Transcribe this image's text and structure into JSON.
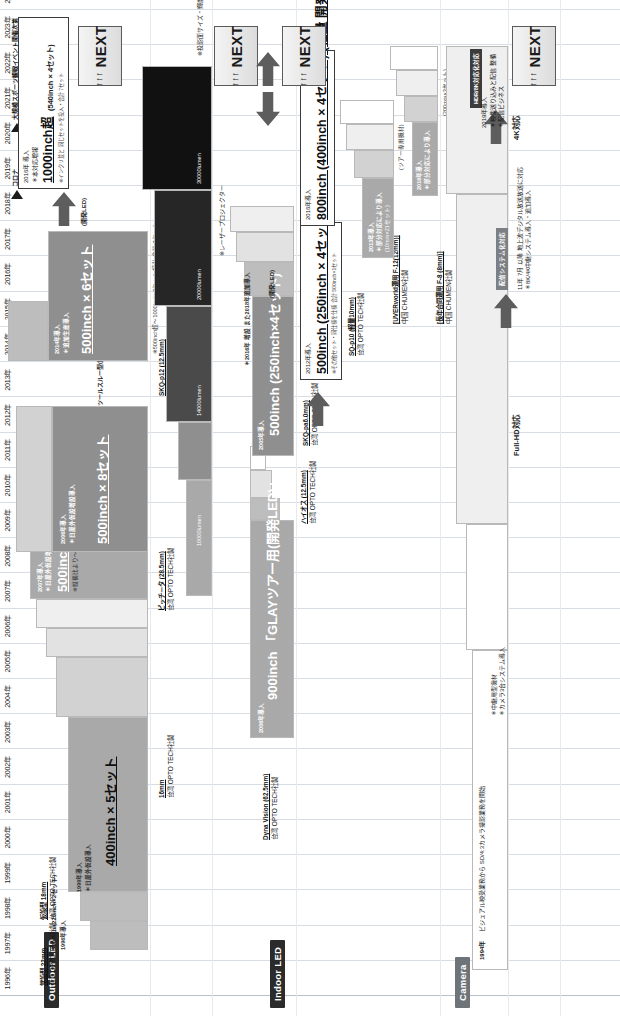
{
  "chart_data": {
    "type": "bar",
    "xlabel": "年",
    "ylabel": "",
    "grid": true,
    "legend": "none",
    "x": [
      "1996年",
      "1997年",
      "1998年",
      "1999年",
      "2000年",
      "2001年",
      "2002年",
      "2003年",
      "2004年",
      "2005年",
      "2006年",
      "2007年",
      "2008年",
      "2009年",
      "2010年",
      "2011年",
      "2012年",
      "2013年",
      "2014年",
      "2015年",
      "2016年",
      "2017年",
      "2018年",
      "2019年",
      "2020年",
      "2021年",
      "2022年",
      "2023年",
      "2024年"
    ],
    "series": [
      {
        "name": "Projector 明るさ (lumen)",
        "unit": "lumen",
        "values": [
          null,
          null,
          null,
          null,
          null,
          null,
          null,
          null,
          null,
          null,
          null,
          null,
          null,
          null,
          5000,
          10000,
          14000,
          14000,
          20000,
          20000,
          30000,
          30000,
          30000,
          30000,
          30000,
          30000,
          30000,
          30000,
          30000
        ]
      },
      {
        "name": "Outdoor LED 画面サイズ (inch)",
        "unit": "inch",
        "values": [
          null,
          200,
          200,
          400,
          400,
          400,
          400,
          400,
          400,
          500,
          500,
          500,
          500,
          500,
          500,
          500,
          500,
          500,
          500,
          500,
          500,
          500,
          500,
          500,
          500,
          500,
          500,
          500,
          500
        ]
      },
      {
        "name": "Indoor LED 画面サイズ (inch)",
        "unit": "inch",
        "values": [
          null,
          null,
          null,
          null,
          null,
          null,
          null,
          null,
          null,
          900,
          900,
          900,
          900,
          900,
          900,
          900,
          500,
          500,
          500,
          500,
          800,
          800,
          800,
          800,
          800,
          800,
          800,
          800,
          1000
        ]
      }
    ]
  },
  "axis": {
    "years": [
      "1996年",
      "1997年",
      "1998年",
      "1999年",
      "2000年",
      "2001年",
      "2002年",
      "2003年",
      "2004年",
      "2005年",
      "2006年",
      "2007年",
      "2008年",
      "2009年",
      "2010年",
      "2011年",
      "2012年",
      "2013年",
      "2014年",
      "2015年",
      "2016年",
      "2017年",
      "2018年",
      "2019年",
      "2020年",
      "2021年",
      "2022年",
      "2023年",
      "2024年"
    ],
    "markers": [
      {
        "label": "コロナ",
        "year": "2020年"
      },
      {
        "label": "大規模スポーツ観戦イベント開催次第",
        "year": "2022年"
      }
    ]
  },
  "categories": {
    "projector": "Projector",
    "outdoor_led": "Outdoor LED",
    "indoor_led": "Indoor LED",
    "camera": "Camera"
  },
  "projector": {
    "lumens": [
      "10000lumen",
      "14000lumen",
      "20000lumen",
      "30000lumen"
    ],
    "laser_note": "※レーザープロジェクター",
    "next_note": "※投影面サイズ・輝度・パワーを更に大きく＝60000lm",
    "next": {
      "label": "NEXT",
      "arrows": "↑↑↑"
    }
  },
  "outdoor_led": {
    "head_1": {
      "title": "常設型 22mm",
      "vendor": "台湾 OPTO TECH社製"
    },
    "head_2": {
      "title": "仮設型 18mm",
      "vendor": "台湾 OPTO TECH社製"
    },
    "bar_1994": {
      "year": "1996年導入",
      "label": "350inch (220inch×2セット)"
    },
    "bar_400": {
      "title": "400inch × 5セット",
      "year": "1999年導入",
      "note": "＊日屋外仮設導入"
    },
    "spec_16mm": {
      "title": "16mm",
      "vendor": "台湾 OPTO TECH社製"
    },
    "spec_p28": {
      "title": "ピッチ－タ (28.5mm)",
      "vendor": "台湾 OPTO TECH社製"
    },
    "bar_500x4": {
      "title": "500inch (250inch×4セット)",
      "year": "2007年導入",
      "note": "＊日屋外仮設増設導入",
      "tiny": "※縦横比より〜500inch×1セット相当に収まった2セット"
    },
    "bar_500x8": {
      "title": "500inch × 8セット",
      "subtitle": "ツールスルー型(開発LED)",
      "year": "2006年導入",
      "note": "＊日屋外仮設増設導入"
    },
    "spec_p12": {
      "title": "SKQ-p12 (12.5mm)",
      "vendor": "台湾 OPTO TECH社製"
    },
    "bar_500x6": {
      "title": "500inch × 6セット",
      "subtitle": "(開発LED)",
      "year": "2014年導入",
      "note": "＊追加生産導入",
      "tiny": "※500inch超〜1000inch×2セット相当 合計 7セット"
    },
    "spec_light": {
      "title": "軽量高精細LED (4.25mm)",
      "vendor": "中国 Alcom社製"
    },
    "callout_1000": {
      "head": "1000inch超",
      "sub": "(540inch × 4セット)",
      "year": "2016年 導入",
      "note": "＊本対応増報",
      "tiny": "※インクリ並と 同じセットを投入・合計 7セット"
    },
    "next": {
      "label": "NEXT",
      "arrows": "↑↑↑"
    }
  },
  "indoor_led": {
    "spec_dyna": {
      "title": "Dyna Vision (62.5mm)",
      "vendor": "台湾 OPTO TECH社製"
    },
    "bar_900": {
      "title": "900inch 「GLAYツアー用(開発LED)」",
      "year": "2006年導入"
    },
    "spec_haios": {
      "title": "ハイオス (12.5mm)",
      "vendor": "台湾 OPTO TECH社製"
    },
    "bar_500x4_dev": {
      "title": "500inch (250inch×4セット)",
      "subtitle": "(開発LED)",
      "year": "2005年導入",
      "note": "＊2016年 増設 また2018年追加導入"
    },
    "spec_p6": {
      "title": "SKQ-pa6.0mm)",
      "vendor": "台湾 OPTO TECH社製"
    },
    "callout_500": {
      "title": "500inch (250inch × 4セット) (開発LED)",
      "year": "2012年導入",
      "tiny": "※その他セット・同仕様を仕様 合計 500inch×1セット"
    },
    "spec_p10": {
      "title": "SQ-p10 (軽量10mm)",
      "vendor": "台湾 OPTO TECH社製"
    },
    "callout_800": {
      "title": "800inch (400inch × 4セット) (軽量 開発LED)",
      "year": "2016年導入"
    },
    "spec_f12": {
      "title": "[UVERworld運用 F-12(12mm)]",
      "vendor": "中国 CHUMEN社製"
    },
    "bar_f12": {
      "year": "2013年導入",
      "note": "＊部分対応により導入",
      "tiny": "(10mm×21セット)",
      "tiny2": "(ツアー専用機材)"
    },
    "spec_f8": {
      "title": "[長年合同運用 F-8 (8mm)]",
      "vendor": "中国 CHUMEN社製"
    },
    "bar_f8": {
      "year": "2016年導入",
      "note": "＊部分対応により導入",
      "tiny": "(200mm×3セット)",
      "tiny2": "(ツアー専用機材)"
    },
    "next": {
      "label": "NEXT",
      "arrows": "↑↑↑"
    }
  },
  "camera": {
    "origin": {
      "year": "1994年",
      "text": "ビジュアル映受業務から SD/4:3カメラ撮影業務を開始"
    },
    "note_sd": "＊中継用型機材\n＊カメラ3台システム導入",
    "fullhd": "Full-HD対応",
    "tag_4k": "4K対応",
    "tag_hdr": "HDR/8K対応化対応",
    "callout_2019": {
      "year": "2019年導入",
      "note": "＊映像送り込みと配信 整備",
      "note2": "＊配信ビジネス"
    },
    "tagchip": "配信システム化対応",
    "footer": "11年 7月 以降 地上波デジタル放送放送に対応\n＊8K/4K中継システム導入・追加導入",
    "next": {
      "label": "NEXT",
      "arrows": "↑↑↑"
    }
  },
  "colors": {
    "grid": "#d8dde3",
    "dark_tag": "#2b2b2b",
    "grey_tag": "#8d9197",
    "arrow": "#5d5d5d",
    "bar_dark": "#262626",
    "bar_mid": "#a9a9a9",
    "bar_light": "#e2e2e2"
  }
}
